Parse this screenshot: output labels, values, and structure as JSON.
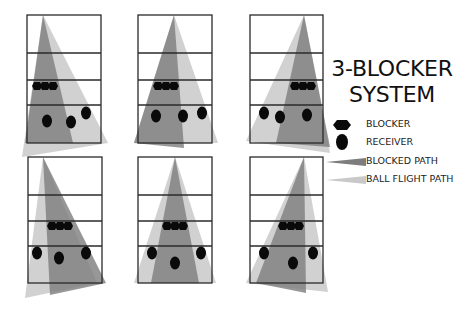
{
  "title": {
    "line1": "3-BLOCKER",
    "line2": "SYSTEM"
  },
  "legend": {
    "items": [
      {
        "icon": "blocker-icon",
        "label": "BLOCKER"
      },
      {
        "icon": "receiver-icon",
        "label": "RECEIVER"
      },
      {
        "icon": "blocked-path-swatch",
        "label": "BLOCKED PATH"
      },
      {
        "icon": "ball-flight-path-swatch",
        "label": "BALL FLIGHT PATH"
      }
    ]
  },
  "colors": {
    "blocked_path": "#7d7d7d",
    "ball_flight_path": "#c9c9c9",
    "court_lines": "#2a2a2a",
    "players": "#0a0a0a"
  },
  "panels": [
    {
      "id": 1,
      "box": {
        "x": 27,
        "y": 15,
        "w": 74,
        "h": 128
      },
      "lines_y": [
        53,
        80,
        105
      ],
      "ball_flight": [
        [
          43,
          15
        ],
        [
          22,
          157
        ],
        [
          108,
          143
        ]
      ],
      "blocked": [
        [
          43,
          15
        ],
        [
          25,
          143
        ],
        [
          73,
          143
        ]
      ],
      "blockers_x": [
        37,
        45,
        53
      ],
      "blockers_y": 86,
      "receivers": [
        [
          47,
          121
        ],
        [
          71,
          122
        ],
        [
          86,
          113
        ]
      ]
    },
    {
      "id": 2,
      "box": {
        "x": 138,
        "y": 15,
        "w": 74,
        "h": 128
      },
      "lines_y": [
        53,
        80,
        105
      ],
      "ball_flight": [
        [
          174,
          15
        ],
        [
          134,
          143
        ],
        [
          218,
          143
        ]
      ],
      "blocked": [
        [
          174,
          15
        ],
        [
          134,
          143
        ],
        [
          184,
          148
        ]
      ],
      "blockers_x": [
        158,
        166,
        174
      ],
      "blockers_y": 86,
      "receivers": [
        [
          156,
          116
        ],
        [
          183,
          116
        ],
        [
          202,
          113
        ]
      ]
    },
    {
      "id": 3,
      "box": {
        "x": 250,
        "y": 15,
        "w": 73,
        "h": 128
      },
      "lines_y": [
        53,
        80,
        105
      ],
      "ball_flight": [
        [
          304,
          15
        ],
        [
          246,
          141
        ],
        [
          330,
          153
        ]
      ],
      "blocked": [
        [
          304,
          15
        ],
        [
          276,
          143
        ],
        [
          330,
          147
        ]
      ],
      "blockers_x": [
        295,
        303,
        311
      ],
      "blockers_y": 86,
      "receivers": [
        [
          264,
          113
        ],
        [
          280,
          117
        ],
        [
          307,
          115
        ]
      ]
    },
    {
      "id": 4,
      "box": {
        "x": 28,
        "y": 157,
        "w": 74,
        "h": 126
      },
      "lines_y": [
        195,
        221,
        246
      ],
      "ball_flight": [
        [
          43,
          157
        ],
        [
          25,
          298
        ],
        [
          97,
          283
        ]
      ],
      "blocked": [
        [
          43,
          157
        ],
        [
          50,
          295
        ],
        [
          106,
          283
        ]
      ],
      "blockers_x": [
        52,
        60,
        68
      ],
      "blockers_y": 226,
      "receivers": [
        [
          37,
          253
        ],
        [
          59,
          258
        ],
        [
          86,
          253
        ]
      ]
    },
    {
      "id": 5,
      "box": {
        "x": 138,
        "y": 157,
        "w": 74,
        "h": 126
      },
      "lines_y": [
        195,
        221,
        246
      ],
      "ball_flight": [
        [
          175,
          157
        ],
        [
          134,
          283
        ],
        [
          216,
          283
        ]
      ],
      "blocked": [
        [
          175,
          157
        ],
        [
          151,
          283
        ],
        [
          199,
          283
        ]
      ],
      "blockers_x": [
        167,
        175,
        183
      ],
      "blockers_y": 226,
      "receivers": [
        [
          152,
          253
        ],
        [
          175,
          263
        ],
        [
          201,
          253
        ]
      ]
    },
    {
      "id": 6,
      "box": {
        "x": 250,
        "y": 157,
        "w": 73,
        "h": 126
      },
      "lines_y": [
        195,
        221,
        246
      ],
      "ball_flight": [
        [
          304,
          157
        ],
        [
          246,
          283
        ],
        [
          328,
          292
        ]
      ],
      "blocked": [
        [
          304,
          157
        ],
        [
          256,
          283
        ],
        [
          306,
          293
        ]
      ],
      "blockers_x": [
        283,
        291,
        299
      ],
      "blockers_y": 226,
      "receivers": [
        [
          264,
          253
        ],
        [
          293,
          263
        ],
        [
          313,
          253
        ]
      ]
    }
  ]
}
